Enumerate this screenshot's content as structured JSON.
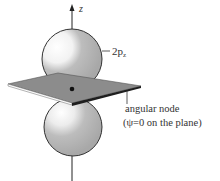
{
  "diagram": {
    "axis_label": "z",
    "orbital_label": "2p",
    "orbital_subscript": "z",
    "node_label_line1": "angular node",
    "node_label_line2": "(ψ=0 on the plane)",
    "colors": {
      "lobe_fill": "#b5b5b5",
      "lobe_highlight": "#ffffff",
      "plane_fill": "#8a8a8a",
      "plane_edge": "#2a2a2a",
      "line": "#222222"
    }
  }
}
